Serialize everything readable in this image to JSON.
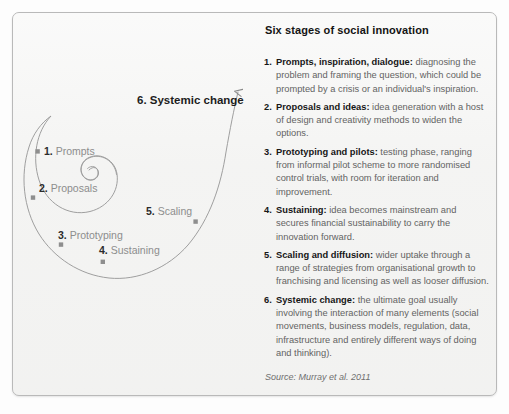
{
  "figure": {
    "border_color": "#b9b9b9",
    "background_color": "#f4f4f3"
  },
  "diagram": {
    "curve_color": "#9a9a9a",
    "marker_color": "#8e8e8e",
    "apex": {
      "num": "6.",
      "label": "Systemic change"
    },
    "nodes": [
      {
        "num": "1.",
        "label": "Prompts"
      },
      {
        "num": "2.",
        "label": "Proposals"
      },
      {
        "num": "3.",
        "label": "Prototyping"
      },
      {
        "num": "4.",
        "label": "Sustaining"
      },
      {
        "num": "5.",
        "label": "Scaling"
      }
    ]
  },
  "panel": {
    "heading": "Six stages of social innovation",
    "stages": [
      {
        "marker": "1.",
        "term": "Prompts, inspiration, dialogue:",
        "description": " diagnosing the problem and framing the question, which could be prompted by a crisis or an individual's inspiration."
      },
      {
        "marker": "2.",
        "term": "Proposals and ideas:",
        "description": " idea generation with a host of design and creativity methods to widen the options."
      },
      {
        "marker": "3.",
        "term": "Prototyping and pilots:",
        "description": " testing phase, ranging from informal pilot scheme to more randomised control trials, with room for iteration and improvement."
      },
      {
        "marker": "4.",
        "term": "Sustaining:",
        "description": " idea becomes mainstream and secures financial sustainability to carry the innovation forward."
      },
      {
        "marker": "5.",
        "term": "Scaling and diffusion:",
        "description": " wider uptake through a range of strategies from organisational growth to franchising and licensing as well as looser diffusion."
      },
      {
        "marker": "6.",
        "term": "Systemic change:",
        "description": " the ultimate goal usually involving the interaction of many elements (social movements, business models, regulation, data, infrastructure and entirely different ways of doing and thinking)."
      }
    ],
    "source": "Source: Murray et al. 2011"
  }
}
